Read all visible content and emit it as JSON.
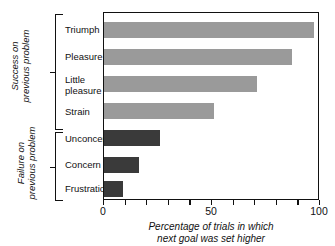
{
  "chart_data": {
    "type": "bar",
    "orientation": "horizontal",
    "title": "",
    "xlabel": "Percentage of trials in which next goal was set higher",
    "xlabel_lines": [
      "Percentage of trials in which",
      "next goal was set higher"
    ],
    "ylabel": "",
    "xlim": [
      0,
      100
    ],
    "xticks": [
      0,
      10,
      20,
      30,
      40,
      50,
      60,
      70,
      80,
      90,
      100
    ],
    "xtick_labels": [
      {
        "value": 0,
        "label": "0"
      },
      {
        "value": 50,
        "label": "50"
      },
      {
        "value": 100,
        "label": "100"
      }
    ],
    "grid": false,
    "legend": "none",
    "categories": [
      "Triumph",
      "Pleasure",
      "Little pleasure",
      "Strain",
      "Unconcern",
      "Concern",
      "Frustration"
    ],
    "values": [
      97,
      87,
      71,
      51,
      26,
      16,
      9
    ],
    "groups": [
      {
        "label": "Success on previous problem",
        "label_lines": [
          "Success on",
          "previous problem"
        ],
        "color": "#9a9a9a",
        "bars": [
          {
            "category": "Triumph",
            "label_lines": [
              "Triumph"
            ],
            "value": 97
          },
          {
            "category": "Pleasure",
            "label_lines": [
              "Pleasure"
            ],
            "value": 87
          },
          {
            "category": "Little pleasure",
            "label_lines": [
              "Little",
              "pleasure"
            ],
            "value": 71
          },
          {
            "category": "Strain",
            "label_lines": [
              "Strain"
            ],
            "value": 51
          }
        ]
      },
      {
        "label": "Failure on previous problem",
        "label_lines": [
          "Failure on",
          "previous problem"
        ],
        "color": "#3a3a3a",
        "bars": [
          {
            "category": "Unconcern",
            "label_lines": [
              "Unconcern"
            ],
            "value": 26
          },
          {
            "category": "Concern",
            "label_lines": [
              "Concern"
            ],
            "value": 16
          },
          {
            "category": "Frustration",
            "label_lines": [
              "Frustration"
            ],
            "value": 9
          }
        ]
      }
    ],
    "colors": {
      "success_bar": "#9a9a9a",
      "failure_bar": "#3a3a3a",
      "axis": "#111111",
      "background": "#ffffff"
    }
  }
}
